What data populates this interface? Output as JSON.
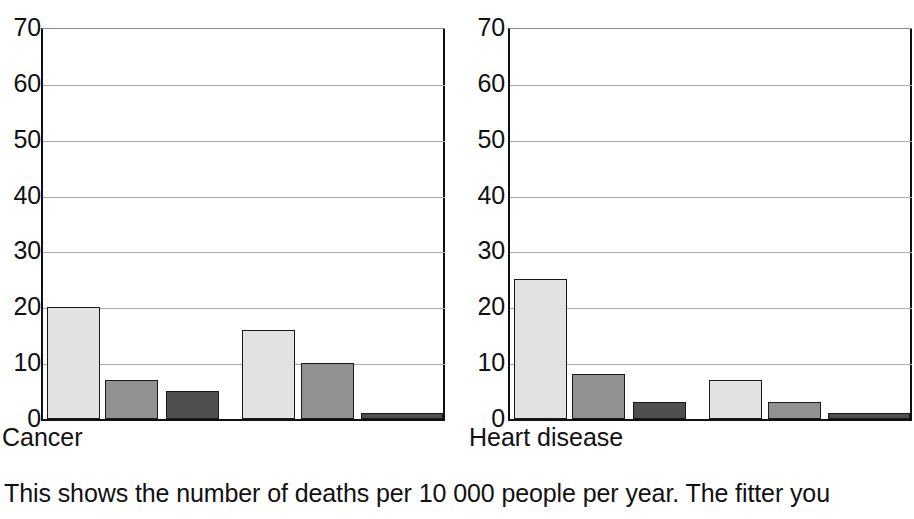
{
  "caption": "This shows the number of deaths per 10 000 people per year. The fitter you",
  "palette": {
    "light": "#e2e2e2",
    "medium": "#919191",
    "dark": "#4f4f4f",
    "outline": "#1a1a1a",
    "gridline": "#a9a9a9",
    "axis": "#111111",
    "background": "#ffffff"
  },
  "chart_data": [
    {
      "type": "bar",
      "title": "Cancer",
      "xlabel": "",
      "ylabel": "",
      "ylim": [
        0,
        70
      ],
      "yticks": [
        0,
        10,
        20,
        30,
        40,
        50,
        60,
        70
      ],
      "ytick_labels": [
        "0",
        "10",
        "20",
        "30",
        "40",
        "50",
        "60",
        "70"
      ],
      "grid": true,
      "legend": "none",
      "groups": [
        "group-1",
        "group-2"
      ],
      "series": [
        {
          "name": "light",
          "values": [
            20,
            16
          ]
        },
        {
          "name": "medium",
          "values": [
            7,
            10
          ]
        },
        {
          "name": "dark",
          "values": [
            5,
            1
          ]
        }
      ],
      "bars": [
        {
          "group": 0,
          "shade": "light",
          "value": 20
        },
        {
          "group": 0,
          "shade": "medium",
          "value": 7
        },
        {
          "group": 0,
          "shade": "dark",
          "value": 5
        },
        {
          "group": 1,
          "shade": "light",
          "value": 16
        },
        {
          "group": 1,
          "shade": "medium",
          "value": 10
        },
        {
          "group": 1,
          "shade": "dark",
          "value": 1
        }
      ]
    },
    {
      "type": "bar",
      "title": "Heart disease",
      "xlabel": "",
      "ylabel": "",
      "ylim": [
        0,
        70
      ],
      "yticks": [
        0,
        10,
        20,
        30,
        40,
        50,
        60,
        70
      ],
      "ytick_labels": [
        "0",
        "10",
        "20",
        "30",
        "40",
        "50",
        "60",
        "70"
      ],
      "grid": true,
      "legend": "none",
      "groups": [
        "group-1",
        "group-2"
      ],
      "series": [
        {
          "name": "light",
          "values": [
            25,
            7
          ]
        },
        {
          "name": "medium",
          "values": [
            8,
            3
          ]
        },
        {
          "name": "dark",
          "values": [
            3,
            1
          ]
        }
      ],
      "bars": [
        {
          "group": 0,
          "shade": "light",
          "value": 25
        },
        {
          "group": 0,
          "shade": "medium",
          "value": 8
        },
        {
          "group": 0,
          "shade": "dark",
          "value": 3
        },
        {
          "group": 1,
          "shade": "light",
          "value": 7
        },
        {
          "group": 1,
          "shade": "medium",
          "value": 3
        },
        {
          "group": 1,
          "shade": "dark",
          "value": 1
        }
      ]
    }
  ]
}
